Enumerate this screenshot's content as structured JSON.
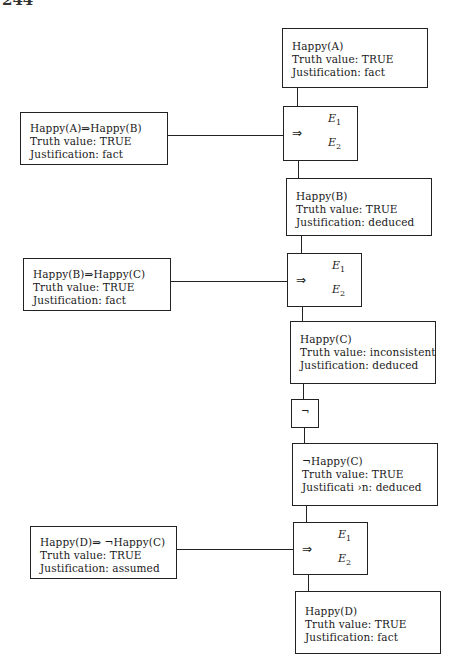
{
  "page": {
    "number": "244"
  },
  "nodes": {
    "happy_a": {
      "line1": "Happy(A)",
      "line2": "Truth value: TRUE",
      "line3": "Justification: fact"
    },
    "impl_ab": {
      "line1": "Happy(A)⇒Happy(B)",
      "line2": "Truth value: TRUE",
      "line3": "Justification: fact"
    },
    "happy_b": {
      "line1": "Happy(B)",
      "line2": "Truth value: TRUE",
      "line3": "Justification: deduced"
    },
    "impl_bc": {
      "line1": "Happy(B)⇒Happy(C)",
      "line2": "Truth value: TRUE",
      "line3": "Justification: fact"
    },
    "happy_c": {
      "line1": "Happy(C)",
      "line2": "Truth value: inconsistent",
      "line3": "Justification: deduced"
    },
    "not_happy_c": {
      "line1": "¬Happy(C)",
      "line2": "Truth value: TRUE",
      "line3": "Justificati ›n: deduced"
    },
    "impl_dnc": {
      "line1": "Happy(D)⇒ ¬Happy(C)",
      "line2": "Truth value: TRUE",
      "line3": "Justification: assumed"
    },
    "happy_d": {
      "line1": "Happy(D)",
      "line2": "Truth value: TRUE",
      "line3": "Justification: fact"
    }
  },
  "operators": {
    "implies_1": {
      "symbol": "⇒",
      "e1": "E",
      "e1_sub": "1",
      "e2": "E",
      "e2_sub": "2"
    },
    "implies_2": {
      "symbol": "⇒",
      "e1": "E",
      "e1_sub": "1",
      "e2": "E",
      "e2_sub": "2"
    },
    "negation": {
      "symbol": "¬"
    },
    "implies_3": {
      "symbol": "⇒",
      "e1": "E",
      "e1_sub": "1",
      "e2": "E",
      "e2_sub": "2"
    }
  }
}
